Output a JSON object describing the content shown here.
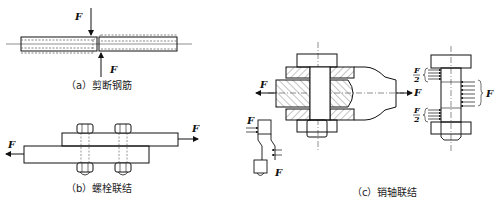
{
  "figure": {
    "panels": [
      {
        "id": "a",
        "caption": "（a）剪断钢筋",
        "force_label": "F"
      },
      {
        "id": "b",
        "caption": "（b）螺栓联结",
        "force_label": "F"
      },
      {
        "id": "c",
        "caption": "（c）销轴联结",
        "force_label": "F",
        "half_force_label_num": "F",
        "half_force_label_den": "2"
      }
    ]
  }
}
